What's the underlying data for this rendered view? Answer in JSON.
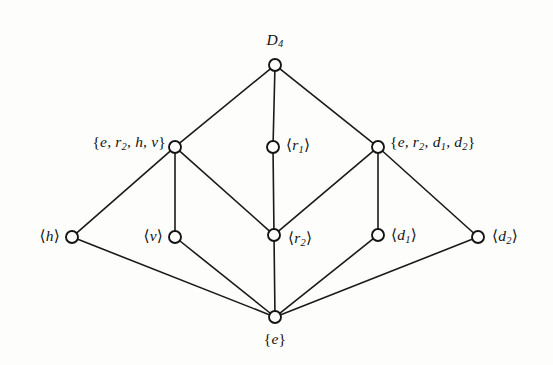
{
  "figure": {
    "kind": "hasse-diagram",
    "background_color": "#fdfdfc",
    "line_color": "#1a1a1a",
    "node_fill_color": "#fdfdfc",
    "node_stroke_color": "#141414",
    "width": 553,
    "height": 365
  },
  "chart_data": {
    "type": "diagram",
    "nodes": [
      {
        "id": "top",
        "label": "D4",
        "label_html": "D<sub>4</sub>",
        "x": 275,
        "y": 65,
        "label_x": 275,
        "label_y": 50,
        "anchor": "center-above",
        "level": 0
      },
      {
        "id": "ehv",
        "label": "{e, r2, h, v}",
        "label_html": "<span class=\"brace\">{</span>e, r<sub>2</sub>, h, v<span class=\"brace\">}</span>",
        "x": 175,
        "y": 147,
        "label_x": 166,
        "label_y": 143,
        "anchor": "right",
        "level": 1
      },
      {
        "id": "r1",
        "label": "<r1>",
        "label_html": "<span class=\"ang\">&#10216;</span>r<sub>1</sub><span class=\"ang\">&#10217;</span>",
        "x": 273,
        "y": 147,
        "label_x": 286,
        "label_y": 146,
        "anchor": "left",
        "level": 1
      },
      {
        "id": "edd",
        "label": "{e, r2, d1, d2}",
        "label_html": "<span class=\"brace\">{</span>e, r<sub>2</sub>, d<sub>1</sub>, d<sub>2</sub><span class=\"brace\">}</span>",
        "x": 378,
        "y": 147,
        "label_x": 390,
        "label_y": 143,
        "anchor": "left",
        "level": 1
      },
      {
        "id": "h",
        "label": "<h>",
        "label_html": "<span class=\"ang\">&#10216;</span>h<span class=\"ang\">&#10217;</span>",
        "x": 72,
        "y": 237,
        "label_x": 60,
        "label_y": 236,
        "anchor": "right",
        "level": 2
      },
      {
        "id": "v",
        "label": "<v>",
        "label_html": "<span class=\"ang\">&#10216;</span>v<span class=\"ang\">&#10217;</span>",
        "x": 175,
        "y": 237,
        "label_x": 163,
        "label_y": 236,
        "anchor": "right",
        "level": 2
      },
      {
        "id": "r2",
        "label": "<r2>",
        "label_html": "<span class=\"ang\">&#10216;</span>r<sub>2</sub><span class=\"ang\">&#10217;</span>",
        "x": 274,
        "y": 235,
        "label_x": 288,
        "label_y": 239,
        "anchor": "left",
        "level": 2
      },
      {
        "id": "d1",
        "label": "<d1>",
        "label_html": "<span class=\"ang\">&#10216;</span>d<sub>1</sub><span class=\"ang\">&#10217;</span>",
        "x": 378,
        "y": 235,
        "label_x": 391,
        "label_y": 236,
        "anchor": "left",
        "level": 2
      },
      {
        "id": "d2",
        "label": "<d2>",
        "label_html": "<span class=\"ang\">&#10216;</span>d<sub>2</sub><span class=\"ang\">&#10217;</span>",
        "x": 478,
        "y": 237,
        "label_x": 492,
        "label_y": 237,
        "anchor": "left",
        "level": 2
      },
      {
        "id": "e",
        "label": "{e}",
        "label_html": "<span class=\"brace\">{</span>e<span class=\"brace\">}</span>",
        "x": 275,
        "y": 317,
        "label_x": 275,
        "label_y": 331,
        "anchor": "center-below",
        "level": 3
      }
    ],
    "edges": [
      {
        "from": "top",
        "to": "ehv"
      },
      {
        "from": "top",
        "to": "r1"
      },
      {
        "from": "top",
        "to": "edd"
      },
      {
        "from": "ehv",
        "to": "h"
      },
      {
        "from": "ehv",
        "to": "v"
      },
      {
        "from": "ehv",
        "to": "r2"
      },
      {
        "from": "r1",
        "to": "r2"
      },
      {
        "from": "edd",
        "to": "r2"
      },
      {
        "from": "edd",
        "to": "d1"
      },
      {
        "from": "edd",
        "to": "d2"
      },
      {
        "from": "h",
        "to": "e"
      },
      {
        "from": "v",
        "to": "e"
      },
      {
        "from": "r2",
        "to": "e"
      },
      {
        "from": "d1",
        "to": "e"
      },
      {
        "from": "d2",
        "to": "e"
      }
    ],
    "node_radius": 6.0,
    "legend": [],
    "grid": false
  }
}
